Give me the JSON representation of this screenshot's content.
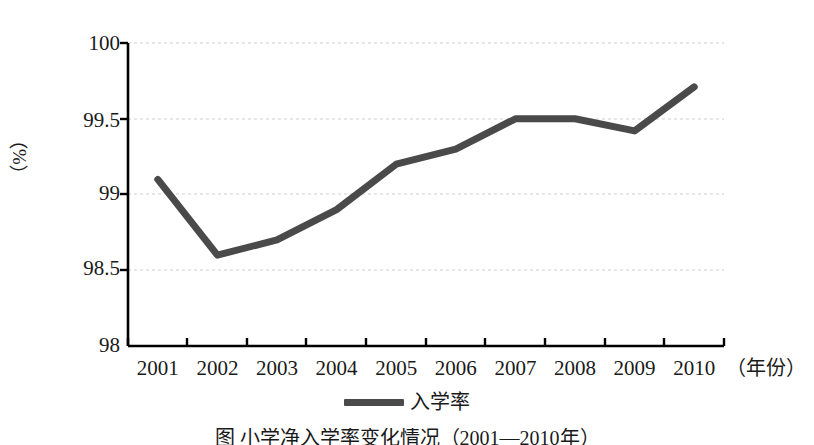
{
  "chart_data": {
    "type": "line",
    "title": "",
    "xlabel": "（年份）",
    "ylabel": "（%）",
    "categories": [
      "2001",
      "2002",
      "2003",
      "2004",
      "2005",
      "2006",
      "2007",
      "2008",
      "2009",
      "2010"
    ],
    "series": [
      {
        "name": "入学率",
        "values": [
          99.1,
          98.6,
          98.7,
          98.9,
          99.2,
          99.3,
          99.5,
          99.5,
          99.42,
          99.71
        ],
        "color": "#4a4a4a"
      }
    ],
    "ylim": [
      98,
      100
    ],
    "yticks": [
      98,
      98.5,
      99,
      99.5,
      100
    ],
    "ytick_labels": [
      "98",
      "98.5",
      "99",
      "99.5",
      "100"
    ],
    "grid": "horizontal-dashed",
    "grid_color": "#cccccc",
    "axis_color": "#000000",
    "legend_position": "bottom-center"
  },
  "axes": {
    "y_title": "（%）",
    "x_title": "（年份）"
  },
  "legend": {
    "entries": [
      {
        "label": "入学率",
        "color": "#4a4a4a"
      }
    ]
  },
  "caption": {
    "text": "图 小学净入学率变化情况（2001—2010年）"
  }
}
